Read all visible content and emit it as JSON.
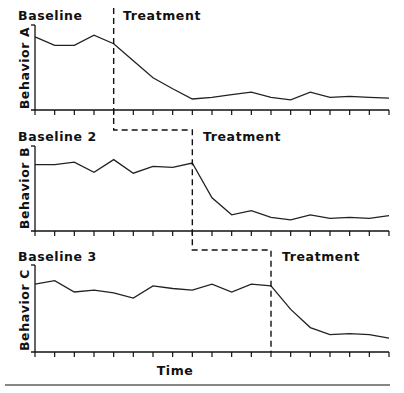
{
  "chart_data": {
    "type": "line",
    "title": "",
    "xlabel": "Time",
    "x": [
      1,
      2,
      3,
      4,
      5,
      6,
      7,
      8,
      9,
      10,
      11,
      12,
      13,
      14,
      15,
      16,
      17,
      18,
      19
    ],
    "ylim": [
      0,
      100
    ],
    "grid": false,
    "panels": [
      {
        "ylabel": "Behavior A",
        "phase_labels": [
          "Baseline",
          "Treatment"
        ],
        "phase_change_after_x": 5,
        "values": [
          86,
          76,
          76,
          88,
          78,
          58,
          38,
          25,
          13,
          15,
          18,
          21,
          15,
          12,
          21,
          15,
          16,
          15,
          14
        ]
      },
      {
        "ylabel": "Behavior B",
        "phase_labels": [
          "Baseline 2",
          "Treatment"
        ],
        "phase_change_after_x": 9,
        "values": [
          78,
          78,
          81,
          69,
          84,
          68,
          76,
          75,
          80,
          39,
          19,
          24,
          16,
          13,
          19,
          15,
          16,
          15,
          18
        ]
      },
      {
        "ylabel": "Behavior C",
        "phase_labels": [
          "Baseline 3",
          "Treatment"
        ],
        "phase_change_after_x": 13,
        "values": [
          78,
          82,
          69,
          71,
          68,
          62,
          76,
          73,
          71,
          78,
          69,
          78,
          76,
          49,
          28,
          20,
          21,
          20,
          16
        ]
      }
    ]
  },
  "labels": {
    "panel_a_baseline": "Baseline",
    "panel_a_treatment": "Treatment",
    "panel_a_ylabel": "Behavior A",
    "panel_b_baseline": "Baseline 2",
    "panel_b_treatment": "Treatment",
    "panel_b_ylabel": "Behavior B",
    "panel_c_baseline": "Baseline 3",
    "panel_c_treatment": "Treatment",
    "panel_c_ylabel": "Behavior C",
    "xlabel": "Time"
  },
  "colors": {
    "line": "#222222",
    "axis": "#111111",
    "background": "#ffffff"
  }
}
